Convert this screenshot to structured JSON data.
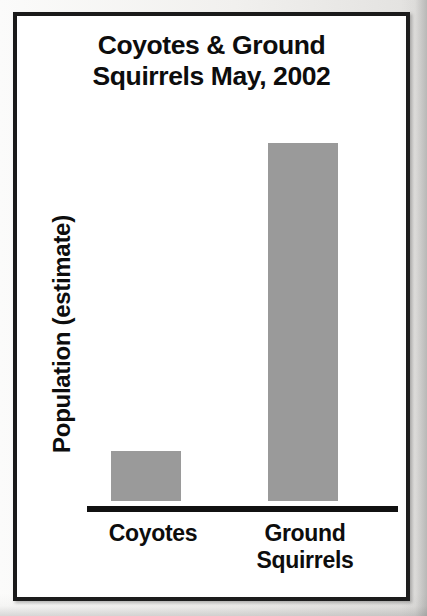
{
  "figure": {
    "title_line_1": "Coyotes & Ground",
    "title_line_2": "Squirrels May, 2002",
    "y_axis_label": "Population (estimate)",
    "category_0_line_1": "Coyotes",
    "category_1_line_1": "Ground",
    "category_1_line_2": "Squirrels",
    "bar_color": "#9a9a9a",
    "axis_color": "#111111",
    "text_color": "#0d0d0d",
    "frame_color": "#1a1a1a",
    "plot_background": "#ffffff"
  },
  "chart_data": {
    "type": "bar",
    "title": "Coyotes & Ground Squirrels May, 2002",
    "categories": [
      "Coyotes",
      "Ground Squirrels"
    ],
    "values": [
      50,
      358
    ],
    "value_units": "relative bar height in pixels (no numeric y-axis scale printed)",
    "series": [
      {
        "name": "Population (estimate)",
        "values": [
          50,
          358
        ]
      }
    ],
    "xlabel": "",
    "ylabel": "Population (estimate)",
    "ylim": [
      0,
      375
    ],
    "y_tick_labels": [],
    "x_tick_labels": [
      "Coyotes",
      "Ground Squirrels"
    ],
    "grid": false,
    "legend": false,
    "legend_position": "none",
    "annotations": []
  }
}
